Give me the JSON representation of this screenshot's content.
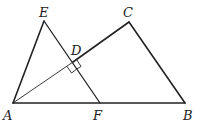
{
  "diagram": {
    "type": "geometry",
    "points": {
      "A": {
        "label": "A",
        "x": 13,
        "y": 103
      },
      "B": {
        "label": "B",
        "x": 185,
        "y": 103
      },
      "C": {
        "label": "C",
        "x": 129,
        "y": 22
      },
      "D": {
        "label": "D",
        "x": 73,
        "y": 62
      },
      "E": {
        "label": "E",
        "x": 44,
        "y": 21
      },
      "F": {
        "label": "F",
        "x": 100,
        "y": 103
      }
    },
    "segments": [
      "AB",
      "BC",
      "CA",
      "AE",
      "EF"
    ],
    "right_angle_at": "D",
    "colors": {
      "stroke": "#222222",
      "background": "#ffffff"
    }
  }
}
